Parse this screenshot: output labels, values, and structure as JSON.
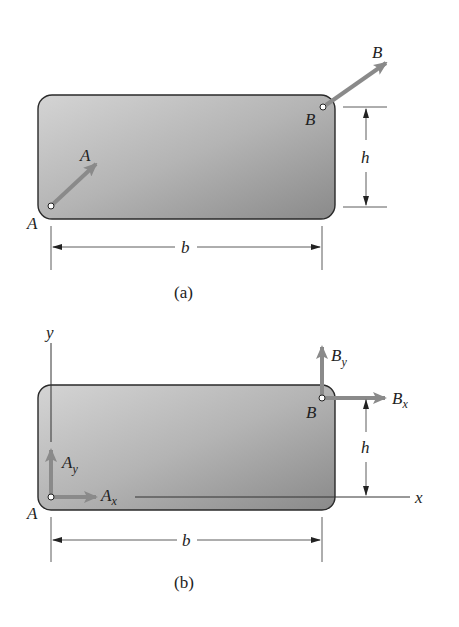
{
  "figure": {
    "colors": {
      "plate_light": "#cfcfcf",
      "plate_dark": "#8c8c8c",
      "plate_border": "#2a2a2a",
      "arrow": "#8a8a8a",
      "line": "#333333",
      "text": "#222222"
    },
    "part_a": {
      "caption": "(a)",
      "point_a_label": "A",
      "force_a_label": "A",
      "point_b_label": "B",
      "force_b_label": "B",
      "height_label": "h",
      "width_label": "b"
    },
    "part_b": {
      "caption": "(b)",
      "y_axis_label": "y",
      "x_axis_label": "x",
      "point_a_label": "A",
      "point_b_label": "B",
      "ax_label": {
        "base": "A",
        "sub": "x"
      },
      "ay_label": {
        "base": "A",
        "sub": "y"
      },
      "bx_label": {
        "base": "B",
        "sub": "x"
      },
      "by_label": {
        "base": "B",
        "sub": "y"
      },
      "height_label": "h",
      "width_label": "b"
    }
  }
}
